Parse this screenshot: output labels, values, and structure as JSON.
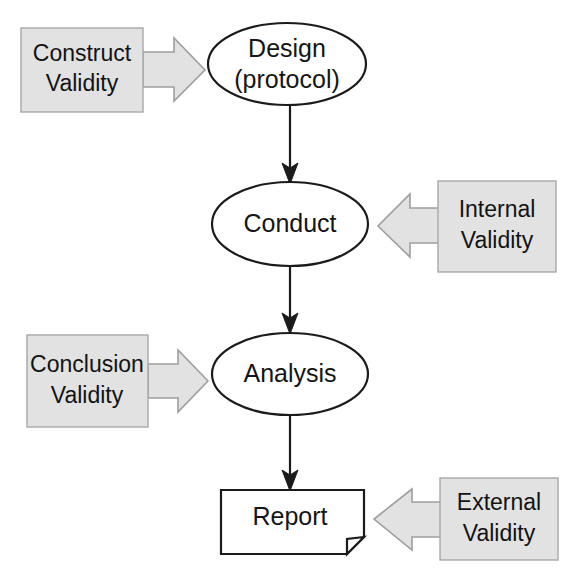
{
  "diagram": {
    "background_color": "#ffffff",
    "node_fill_color": "#ffffff",
    "node_stroke_color": "#1b1b1b",
    "annotation_fill_color": "#e2e2e2",
    "annotation_stroke_color": "#a8a8a8",
    "arrow_color": "#1b1b1b",
    "nodes": [
      {
        "id": "design",
        "shape": "ellipse",
        "line1": "Design",
        "line2": "(protocol)",
        "cx": 287,
        "cy": 64,
        "rx": 79,
        "ry": 41
      },
      {
        "id": "conduct",
        "shape": "ellipse",
        "line1": "Conduct",
        "line2": "",
        "cx": 290,
        "cy": 224,
        "rx": 78,
        "ry": 42
      },
      {
        "id": "analysis",
        "shape": "ellipse",
        "line1": "Analysis",
        "line2": "",
        "cx": 290,
        "cy": 374,
        "rx": 78,
        "ry": 41
      },
      {
        "id": "report",
        "shape": "document",
        "line1": "Report",
        "line2": "",
        "x": 221,
        "y": 490,
        "width": 143,
        "height": 64
      }
    ],
    "annotations": [
      {
        "id": "construct-validity",
        "line1": "Construct",
        "line2": "Validity",
        "direction": "right",
        "box_x": 21,
        "box_y": 28,
        "box_width": 122,
        "box_height": 84,
        "arrow_tip_x": 205,
        "arrow_mid_y": 70
      },
      {
        "id": "internal-validity",
        "line1": "Internal",
        "line2": "Validity",
        "direction": "left",
        "box_x": 438,
        "box_y": 181,
        "box_width": 118,
        "box_height": 91,
        "arrow_tip_x": 378,
        "arrow_mid_y": 226
      },
      {
        "id": "conclusion-validity",
        "line1": "Conclusion",
        "line2": "Validity",
        "direction": "right",
        "box_x": 27,
        "box_y": 335,
        "box_width": 121,
        "box_height": 92,
        "arrow_tip_x": 208,
        "arrow_mid_y": 381
      },
      {
        "id": "external-validity",
        "line1": "External",
        "line2": "Validity",
        "direction": "left",
        "box_x": 440,
        "box_y": 478,
        "box_width": 118,
        "box_height": 82,
        "arrow_tip_x": 374,
        "arrow_mid_y": 519
      }
    ],
    "connectors": [
      {
        "id": "design-to-conduct",
        "from": "design",
        "to": "conduct",
        "x": 290,
        "y1": 106,
        "y2": 182
      },
      {
        "id": "conduct-to-analysis",
        "from": "conduct",
        "to": "analysis",
        "x": 290,
        "y1": 266,
        "y2": 332
      },
      {
        "id": "analysis-to-report",
        "from": "analysis",
        "to": "report",
        "x": 290,
        "y1": 415,
        "y2": 489
      }
    ]
  }
}
